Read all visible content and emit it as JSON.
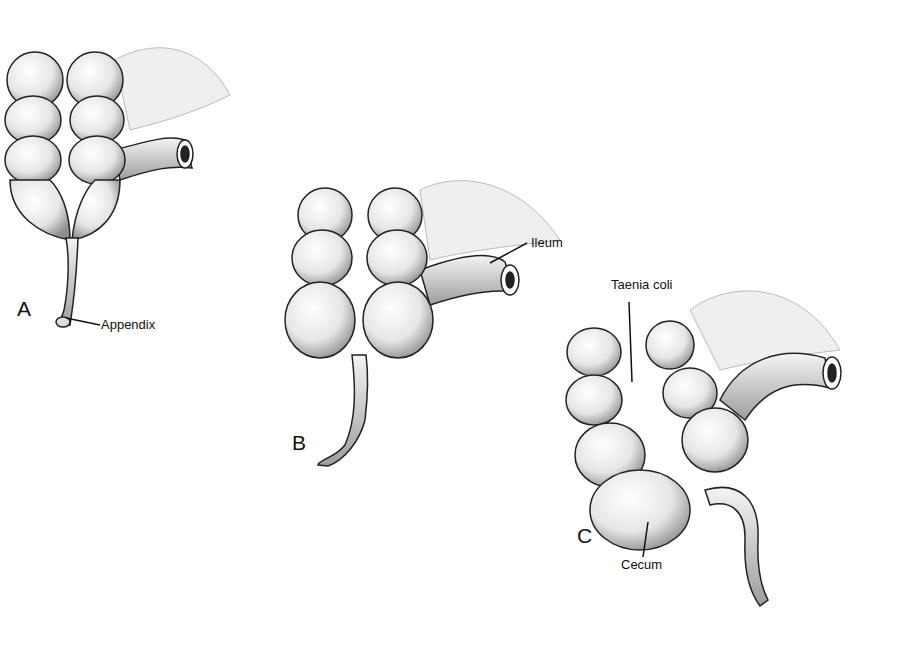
{
  "figure": {
    "panels": [
      {
        "id": "A",
        "letter": "A",
        "labels": [
          "Appendix"
        ]
      },
      {
        "id": "B",
        "letter": "B",
        "labels": [
          "Ileum"
        ]
      },
      {
        "id": "C",
        "letter": "C",
        "labels": [
          "Taenia coli",
          "Cecum"
        ]
      }
    ],
    "labels": {
      "appendix": "Appendix",
      "ileum": "Ileum",
      "taenia_coli": "Taenia coli",
      "cecum": "Cecum"
    },
    "letters": {
      "a": "A",
      "b": "B",
      "c": "C"
    },
    "colors": {
      "ink": "#111111",
      "shade": "#9a9a9a",
      "fill": "#f2f2f2",
      "background": "#ffffff"
    }
  }
}
